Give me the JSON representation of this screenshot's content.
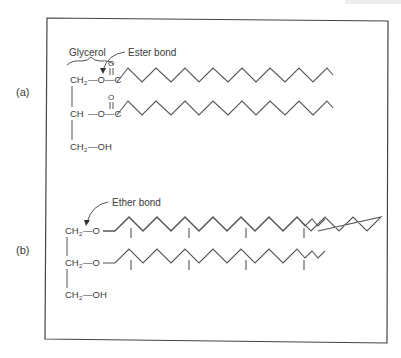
{
  "figure": {
    "panel_a": {
      "label": "(a)",
      "annotations": {
        "glycerol": "Glycerol",
        "ester_bond": "Ester bond"
      },
      "rows": [
        {
          "left": "CH",
          "sub": "2",
          "link": "—O—C"
        },
        {
          "left": "CH",
          "sub": "",
          "link": "—O—C"
        },
        {
          "left": "CH",
          "sub": "2",
          "link": "—OH"
        }
      ],
      "carbonyl_o": "O"
    },
    "panel_b": {
      "label": "(b)",
      "annotations": {
        "ether_bond": "Ether bond"
      },
      "rows": [
        {
          "left": "CH",
          "sub": "2",
          "link": "—O"
        },
        {
          "left": "CH",
          "sub": "2",
          "link": "—O"
        },
        {
          "left": "CH",
          "sub": "2",
          "link": "—OH"
        }
      ]
    },
    "colors": {
      "line": "#555555",
      "text": "#3a3a3a",
      "frame": "#444444"
    }
  }
}
